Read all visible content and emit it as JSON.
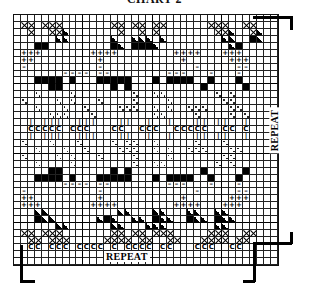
{
  "title": "CHART 2",
  "labels": {
    "repeat_bottom": "REPEAT",
    "repeat_right": "REPEAT"
  },
  "grid": {
    "cols": 38,
    "rows": 36,
    "cell_px": 7,
    "origin": [
      13,
      14
    ]
  },
  "symbols": {
    "x": "cross-stitch-x",
    "fill": "solid-black",
    "tri": "half-black-triangle",
    "plus": "+",
    "dash": "–",
    "figure": "ᴥ",
    "dot": "dots",
    "bar": "|",
    "c": "C"
  },
  "pattern": [
    "......................................",
    ".xx.xxx.......xx.xx.xx......xxx..xx...",
    "..x..xxt.......x..x.x........xxt..xt..",
    "......tt......t..ttt.t........tt..ft..",
    "...ff.........ft.ffft..........tf.....",
    ".+++.......++++........++++...+++.....",
    ".++.........+...........+......+++....",
    ".-..........-.............-.....--....",
    ".......----.--........---...-...-.....",
    "...ffff.f...fffff...f.ffff..f...f.....",
    ".....ff.......f.f..........f.....f....",
    "...:....:........:..::.......:.:......",
    ".:....:.:...:....:....:.......::......",
    "...:...:..:....:::..:.:..:::...::.....",
    ".....:::...:........::....:....:.:....",
    "..|.|||..|||...||..|..|...||.||..|....",
    "..CCCCC.CCC...CC..CCC..CCCCC..CC.C....",
    "..|.|||..|||...||..|..|...||.||..|....",
    ".:...:...:....:.::..:.....:...:.......",
    "...:...:..:....:::..:.:..:::...::.....",
    ".:....:.:...:....:....:.......::......",
    "...:....:........:..::.......:.:......",
    ".....ff.......f.f..........f.....f....",
    "...ffff.f...fffff...f.ffff..f...f.....",
    ".......----.--........---...-...-.....",
    ".-..........-.............-.....--....",
    ".++.........+...........+......+++....",
    ".+++.......++++........++++...+++.....",
    "...tt..........tt...tt...tt..tt.......",
    "...ftt......tft..tt.ftt..ftt.ftt......",
    "......tt......tt...ttt.......tt.......",
    ".xx.xxx.......xx.xx.xxx.....xxx..xx...",
    "..xx.xxx.....xxxx.xx..xx...xxxx.xx....",
    "..CC.CCC.CCCC.C.CCCC.CC...CCC..CC.....",
    "......................................",
    "......................................"
  ],
  "brackets": [
    {
      "name": "top-right-bracket",
      "segments": [
        [
          253,
          16,
          39,
          2.5
        ],
        [
          290,
          16,
          2.5,
          14
        ]
      ]
    },
    {
      "name": "right-lower-bracket",
      "segments": [
        [
          253,
          242,
          39,
          2.5
        ],
        [
          290,
          232,
          2.5,
          12
        ],
        [
          253,
          242,
          2.5,
          40
        ],
        [
          243,
          280,
          12,
          2.5
        ]
      ]
    },
    {
      "name": "bottom-left-bracket",
      "segments": [
        [
          20,
          245,
          2.5,
          37
        ],
        [
          20,
          280,
          15,
          2.5
        ]
      ]
    }
  ]
}
